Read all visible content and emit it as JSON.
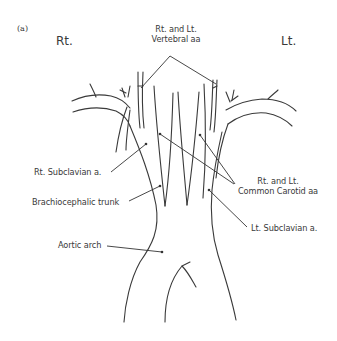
{
  "figure": {
    "panel_label": "(a)",
    "side_labels": {
      "right": "Rt.",
      "left": "Lt."
    },
    "labels": {
      "vertebral_line1": "Rt. and Lt.",
      "vertebral_line2": "Vertebral aa",
      "rt_subclavian": "Rt. Subclavian a.",
      "brachiocephalic": "Brachiocephalic trunk",
      "aortic_arch": "Aortic arch",
      "carotid_line1": "Rt. and Lt.",
      "carotid_line2": "Common Carotid aa",
      "lt_subclavian": "Lt. Subclavian a."
    },
    "colors": {
      "stroke": "#3a3a3a",
      "background": "#ffffff"
    }
  }
}
